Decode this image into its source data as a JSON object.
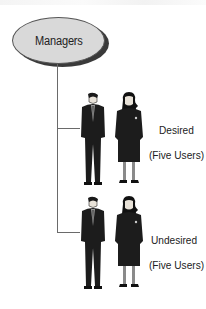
{
  "diagram": {
    "root": {
      "label": "Managers"
    },
    "branches": [
      {
        "title": "Desired",
        "subtitle": "(Five Users)",
        "figures": [
          "man-in-suit",
          "woman-in-suit"
        ]
      },
      {
        "title": "Undesired",
        "subtitle": "(Five Users)",
        "figures": [
          "man-in-suit",
          "woman-in-suit"
        ]
      }
    ],
    "colors": {
      "node_fill": "#d9d9d9",
      "node_shadow": "#3a3a3a",
      "connector": "#6a6a6a",
      "suit": "#1c1c1c",
      "text": "#222222"
    }
  }
}
